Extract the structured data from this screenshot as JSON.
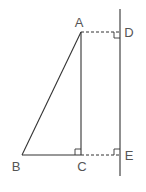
{
  "diagram": {
    "title": "",
    "points": {
      "A": {
        "label": "A",
        "x": 81,
        "y": 32
      },
      "B": {
        "label": "B",
        "x": 22,
        "y": 155
      },
      "C": {
        "label": "C",
        "x": 81,
        "y": 155
      },
      "D": {
        "label": "D",
        "x": 120,
        "y": 32
      },
      "E": {
        "label": "E",
        "x": 120,
        "y": 155
      }
    },
    "segments": [
      {
        "from": "A",
        "to": "B",
        "style": "solid"
      },
      {
        "from": "B",
        "to": "C",
        "style": "solid"
      },
      {
        "from": "A",
        "to": "C",
        "style": "solid"
      },
      {
        "from": "A",
        "to": "D",
        "style": "dashed"
      },
      {
        "from": "C",
        "to": "E",
        "style": "dashed"
      }
    ],
    "line_DE": {
      "x": 120,
      "y_top": 9,
      "y_bottom": 176,
      "style": "solid"
    },
    "right_angle_markers": [
      "C",
      "D",
      "E"
    ],
    "colors": {
      "stroke": "#333333",
      "label": "#555555",
      "background": "#ffffff"
    }
  }
}
